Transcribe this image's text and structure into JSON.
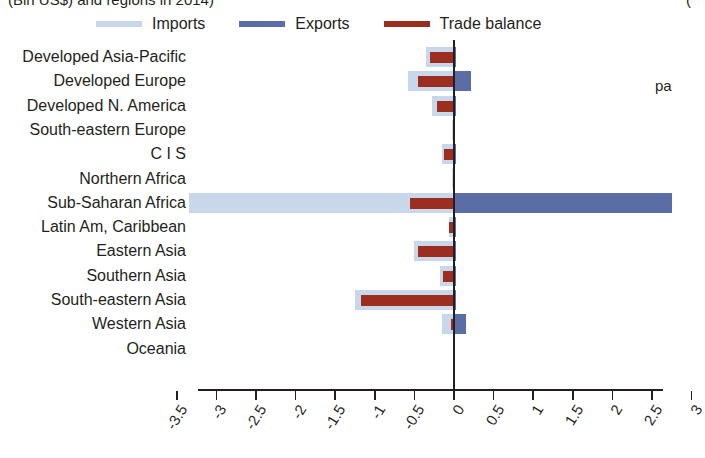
{
  "title": {
    "left_fragment": "(Bln US$) and regions in 2014)",
    "right_fragment": "("
  },
  "margin_note": {
    "text": "pa",
    "x": 655,
    "y": 78
  },
  "legend": {
    "position": "top",
    "entries": [
      {
        "label": "Imports",
        "color": "#c8d7ea",
        "icon": "line-swatch-icon"
      },
      {
        "label": "Exports",
        "color": "#5a6ea5",
        "icon": "line-swatch-icon"
      },
      {
        "label": "Trade balance",
        "color": "#9c2e1f",
        "icon": "line-swatch-icon"
      }
    ]
  },
  "axis": {
    "x_ticks": [
      "-3.5",
      "-3",
      "-2.5",
      "-2",
      "-1.5",
      "-1",
      "-0.5",
      "0",
      "0.5",
      "1",
      "1.5",
      "2",
      "2.5",
      "3"
    ],
    "x_min": -3.5,
    "x_max": 3.0,
    "x_step": 0.5,
    "grid": false
  },
  "chart_data": {
    "type": "bar",
    "orientation": "horizontal",
    "title": "(Bln US$) and regions in 2014)",
    "xlabel": "",
    "ylabel": "",
    "xlim": [
      -3.5,
      3.0
    ],
    "grid": false,
    "legend_position": "top",
    "categories": [
      "Developed Asia-Pacific",
      "Developed Europe",
      "Developed N. America",
      "South-eastern Europe",
      "C I S",
      "Northern Africa",
      "Sub-Saharan Africa",
      "Latin Am, Caribbean",
      "Eastern Asia",
      "Southern Asia",
      "South-eastern Asia",
      "Western Asia",
      "Oceania"
    ],
    "series": [
      {
        "name": "Imports",
        "color": "#c8d7ea",
        "values": [
          -0.35,
          -0.58,
          -0.28,
          -0.02,
          -0.15,
          -0.02,
          -3.35,
          -0.06,
          -0.5,
          -0.18,
          -1.25,
          -0.15,
          0.0
        ]
      },
      {
        "name": "Exports",
        "color": "#5a6ea5",
        "values": [
          0.02,
          0.22,
          0.01,
          0.0,
          0.01,
          0.0,
          2.75,
          0.01,
          0.02,
          0.01,
          0.02,
          0.15,
          0.0
        ]
      },
      {
        "name": "Trade balance",
        "color": "#9c2e1f",
        "values": [
          -0.3,
          -0.46,
          -0.22,
          0.0,
          -0.12,
          0.0,
          -0.55,
          -0.06,
          -0.45,
          -0.14,
          -1.18,
          -0.04,
          0.0
        ]
      }
    ]
  }
}
